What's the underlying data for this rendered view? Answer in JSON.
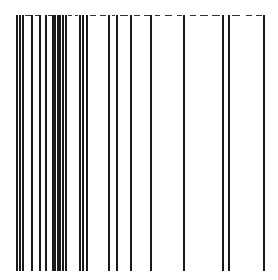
{
  "figure": {
    "type": "vertical-line-pattern",
    "background": "#ffffff",
    "line_color": "#1a1a1a",
    "top_y": 15,
    "bottom_y": 271,
    "line_width": 2,
    "lines_x": [
      17,
      20,
      23,
      32,
      40,
      46,
      53,
      55,
      58,
      60,
      63,
      66,
      80,
      83,
      87,
      109,
      117,
      131,
      151,
      184,
      223,
      229,
      264
    ],
    "top_border": {
      "y": 15,
      "color": "#333333",
      "segments": [
        [
          25,
          31
        ],
        [
          35,
          39
        ],
        [
          48,
          52
        ],
        [
          68,
          72
        ],
        [
          75,
          78
        ],
        [
          90,
          96
        ],
        [
          100,
          106
        ],
        [
          112,
          115
        ],
        [
          120,
          128
        ],
        [
          134,
          140
        ],
        [
          144,
          150
        ],
        [
          155,
          160
        ],
        [
          165,
          172
        ],
        [
          177,
          182
        ],
        [
          190,
          196
        ],
        [
          200,
          208
        ],
        [
          212,
          220
        ],
        [
          232,
          240
        ],
        [
          246,
          252
        ],
        [
          256,
          262
        ]
      ]
    }
  }
}
